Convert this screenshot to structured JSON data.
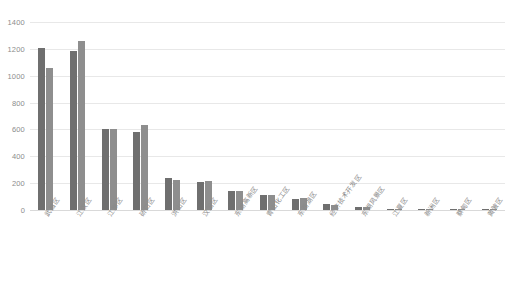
{
  "chart_data": {
    "type": "bar",
    "title": "",
    "subtitle": "",
    "xlabel": "",
    "ylabel": "",
    "ylim": [
      0,
      1400
    ],
    "yticks": [
      0,
      200,
      400,
      600,
      800,
      1000,
      1200,
      1400
    ],
    "ytick_labels": [
      "0",
      "200",
      "400",
      "600",
      "800",
      "1000",
      "1200",
      "1400"
    ],
    "grid": true,
    "legend": "none",
    "orientation": "vertical",
    "grouping": "grouped",
    "categories": [
      "武昌区",
      "江汉区",
      "江岸区",
      "硚口区",
      "洪山区",
      "汉阳区",
      "东湖高新区",
      "青山化工区",
      "东西湖区",
      "经济技术开发区",
      "东湖风景区",
      "江夏区",
      "新洲区",
      "蔡甸区",
      "黄陂区"
    ],
    "series": [
      {
        "name": "series-1",
        "color": "#6f6f6f",
        "values": [
          1205,
          1185,
          600,
          580,
          240,
          205,
          140,
          110,
          85,
          45,
          25,
          10,
          8,
          6,
          5
        ]
      },
      {
        "name": "series-2",
        "color": "#8e8e8e",
        "values": [
          1055,
          1260,
          605,
          635,
          225,
          215,
          140,
          115,
          90,
          40,
          25,
          10,
          8,
          6,
          5
        ]
      }
    ]
  }
}
